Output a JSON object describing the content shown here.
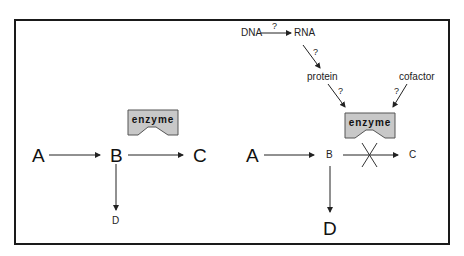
{
  "left_panel": {
    "nodes": {
      "A": "A",
      "B": "B",
      "C": "C",
      "D": "D"
    },
    "enzyme_label": "enzyme",
    "edges": [
      {
        "from": "A",
        "to": "B"
      },
      {
        "from": "B",
        "to": "C"
      },
      {
        "from": "B",
        "to": "D"
      }
    ]
  },
  "right_panel": {
    "nodes": {
      "A": "A",
      "B": "B",
      "C": "C",
      "D": "D"
    },
    "enzyme_label": "enzyme",
    "regulators": {
      "dna": "DNA",
      "rna": "RNA",
      "protein": "protein",
      "cofactor": "cofactor"
    },
    "unknown_marker": "?",
    "edges": [
      {
        "from": "DNA",
        "to": "RNA",
        "label": "?"
      },
      {
        "from": "RNA",
        "to": "protein",
        "label": "?"
      },
      {
        "from": "protein",
        "to": "enzyme",
        "label": "?"
      },
      {
        "from": "cofactor",
        "to": "enzyme",
        "label": "?"
      },
      {
        "from": "A",
        "to": "B"
      },
      {
        "from": "B",
        "to": "C",
        "blocked": true
      },
      {
        "from": "B",
        "to": "D"
      }
    ]
  },
  "colors": {
    "border": "#1a1a1a",
    "enzyme_fill": "#c8c8c8",
    "enzyme_stroke": "#555555",
    "arrow": "#222222"
  }
}
